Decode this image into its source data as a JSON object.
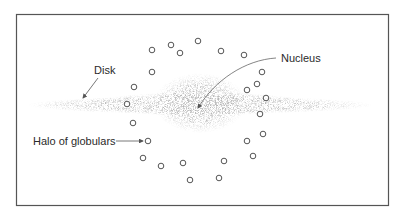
{
  "diagram": {
    "type": "galaxy-structure",
    "frame": {
      "x": 16,
      "y": 14,
      "width": 372,
      "height": 191,
      "stroke": "#555555"
    },
    "labels": {
      "disk": {
        "text": "Disk",
        "x": 94,
        "y": 74
      },
      "nucleus": {
        "text": "Nucleus",
        "x": 283,
        "y": 62
      },
      "halo": {
        "text": "Halo of globulars",
        "x": 33,
        "y": 146
      }
    },
    "arrows": {
      "disk": {
        "from": [
          98,
          78
        ],
        "to": [
          83,
          98
        ]
      },
      "nucleus": {
        "from": [
          276,
          58
        ],
        "to": [
          198,
          108
        ]
      },
      "halo": {
        "from": [
          116,
          141
        ],
        "to": [
          144,
          141
        ]
      }
    },
    "disk": {
      "cx": 200,
      "cy": 105,
      "rx": 170,
      "ry": 8,
      "color": "#a8a8a8"
    },
    "bulge": {
      "cx": 200,
      "cy": 103,
      "rx": 44,
      "ry": 28,
      "color": "#9a9a9a"
    },
    "globular_clusters": [
      [
        152,
        50
      ],
      [
        171,
        45
      ],
      [
        180,
        53
      ],
      [
        198,
        41
      ],
      [
        221,
        51
      ],
      [
        244,
        55
      ],
      [
        152,
        72
      ],
      [
        262,
        72
      ],
      [
        257,
        84
      ],
      [
        247,
        90
      ],
      [
        266,
        98
      ],
      [
        134,
        87
      ],
      [
        127,
        104
      ],
      [
        133,
        123
      ],
      [
        148,
        141
      ],
      [
        260,
        114
      ],
      [
        263,
        134
      ],
      [
        247,
        141
      ],
      [
        253,
        156
      ],
      [
        143,
        158
      ],
      [
        161,
        166
      ],
      [
        183,
        163
      ],
      [
        190,
        180
      ],
      [
        219,
        178
      ],
      [
        224,
        161
      ]
    ],
    "cluster_radius": 2.8,
    "cluster_stroke": "#555555"
  }
}
